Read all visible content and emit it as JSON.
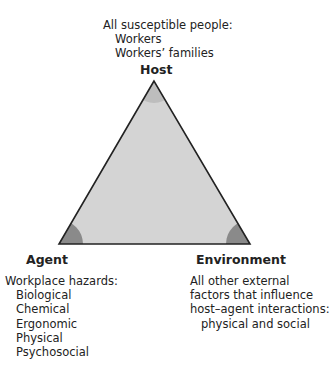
{
  "host": {
    "title": "Host",
    "description": "All susceptible people:",
    "items": [
      "Workers",
      "Workers’ families"
    ]
  },
  "agent": {
    "title": "Agent",
    "description": "Workplace hazards:",
    "items": [
      "Biological",
      "Chemical",
      "Ergonomic",
      "Physical",
      "Psychosocial"
    ]
  },
  "environment": {
    "title": "Environment",
    "description_lines": [
      "All other external",
      "factors that influence",
      "host–agent interactions:"
    ],
    "items": [
      "physical and social"
    ]
  },
  "colors": {
    "triangle_fill": "#d4d4d4",
    "corner_fill": "#8a8a8a",
    "stroke": "#222222"
  }
}
